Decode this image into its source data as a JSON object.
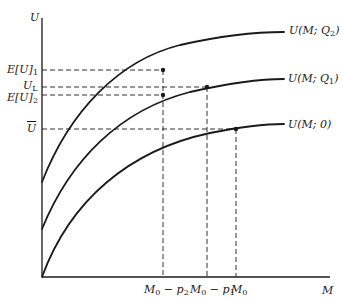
{
  "axes": {
    "y_label": "U",
    "x_label": "M"
  },
  "y_ticks": [
    {
      "id": "EU1",
      "label": "E[U]",
      "sub": "1",
      "y": 70
    },
    {
      "id": "UL",
      "label": "U",
      "sub": "L",
      "y": 87
    },
    {
      "id": "EU2",
      "label": "E[U]",
      "sub": "2",
      "y": 95
    },
    {
      "id": "Ubar",
      "label": "U",
      "sub": "",
      "overline": true,
      "y": 129
    }
  ],
  "x_ticks": [
    {
      "id": "M0-p2",
      "label": "M",
      "sub": "0",
      "suffix": " − p",
      "suffix_sub": "2",
      "x": 163
    },
    {
      "id": "M0-p1",
      "label": "M",
      "sub": "0",
      "suffix": " − p",
      "suffix_sub": "1",
      "x": 207
    },
    {
      "id": "M0",
      "label": "M",
      "sub": "0",
      "x": 236
    }
  ],
  "curves": [
    {
      "id": "Q2",
      "label": "U(M; Q₂)",
      "label_main": "U(M; Q",
      "label_sub": "2",
      "label_end": ")"
    },
    {
      "id": "Q1",
      "label": "U(M; Q₁)",
      "label_main": "U(M; Q",
      "label_sub": "1",
      "label_end": ")"
    },
    {
      "id": "zero",
      "label": "U(M; 0)",
      "label_main": "U(M; 0)",
      "label_sub": "",
      "label_end": ""
    }
  ],
  "points": [
    {
      "id": "EU1-point",
      "x": 163,
      "y": 70
    },
    {
      "id": "UL-point",
      "x": 207,
      "y": 87
    },
    {
      "id": "EU2-point",
      "x": 163,
      "y": 95
    },
    {
      "id": "Ubar-point",
      "x": 236,
      "y": 129
    }
  ],
  "colors": {
    "ink": "#1a1a1a",
    "background": "#ffffff"
  }
}
